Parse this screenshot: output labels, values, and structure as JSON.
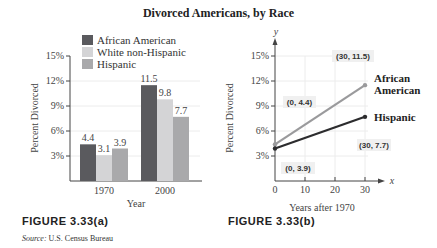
{
  "title": "Divorced Americans, by Race",
  "figure_a_label": "FIGURE  3.33(a)",
  "figure_b_label": "FIGURE  3.33(b)",
  "source_label": "Source:",
  "source_text": " U.S. Census Bureau",
  "colors": {
    "african_american": "#5a5a5e",
    "white_non_hispanic": "#d4d4d6",
    "hispanic": "#a9a9ab",
    "line_african_american": "#9a9a9c",
    "line_hispanic": "#2c2c2e"
  },
  "chart_data": [
    {
      "type": "bar",
      "title": "Divorced Americans, by Race",
      "xlabel": "Year",
      "ylabel": "Percent Divorced",
      "categories": [
        "1970",
        "2000"
      ],
      "series": [
        {
          "name": "African American",
          "values": [
            4.4,
            11.5
          ]
        },
        {
          "name": "White non-Hispanic",
          "values": [
            3.1,
            9.8
          ]
        },
        {
          "name": "Hispanic",
          "values": [
            3.9,
            7.7
          ]
        }
      ],
      "yticks": [
        "3%",
        "6%",
        "9%",
        "12%",
        "15%"
      ],
      "ylim": [
        0,
        15
      ],
      "grid": true,
      "legend_position": "top-left"
    },
    {
      "type": "line",
      "xlabel": "Years after 1970",
      "ylabel": "Percent Divorced",
      "x_axis_symbol": "x",
      "y_axis_symbol": "y",
      "xticks": [
        "0",
        "10",
        "20",
        "30"
      ],
      "yticks": [
        "3%",
        "6%",
        "9%",
        "12%",
        "15%"
      ],
      "xlim": [
        0,
        30
      ],
      "ylim": [
        0,
        15
      ],
      "grid": true,
      "series": [
        {
          "name": "African American",
          "x": [
            0,
            30
          ],
          "y": [
            4.4,
            11.5
          ]
        },
        {
          "name": "Hispanic",
          "x": [
            0,
            30
          ],
          "y": [
            3.9,
            7.7
          ]
        }
      ],
      "annotations": [
        "(0, 4.4)",
        "(30, 11.5)",
        "(0, 3.9)",
        "(30, 7.7)"
      ],
      "series_labels": [
        "African",
        "American",
        "Hispanic"
      ]
    }
  ]
}
